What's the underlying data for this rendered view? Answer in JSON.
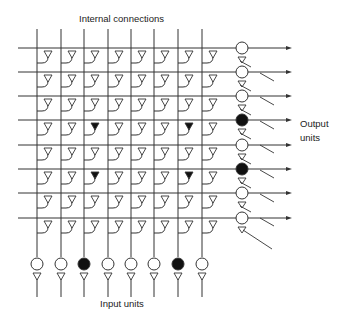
{
  "diagram": {
    "title_labels": {
      "internal": "Internal connections",
      "input": "Input units",
      "output": "Output units"
    },
    "grid": {
      "rows": 8,
      "cols": 8,
      "col_x": [
        37,
        61,
        84,
        108,
        131,
        154,
        178,
        202
      ],
      "row_y": [
        48,
        72,
        96,
        120,
        145,
        169,
        193,
        218
      ],
      "vertical_top": 29,
      "horizontal_left": 18
    },
    "active_synapses": [
      [
        3,
        2
      ],
      [
        3,
        6
      ],
      [
        5,
        2
      ],
      [
        5,
        6
      ]
    ],
    "input_units": {
      "count": 8,
      "circle_y": 264,
      "line_bottom": 297,
      "active": [
        2,
        6
      ]
    },
    "output_units": {
      "count": 8,
      "circle_x": 242,
      "arrow_end_x": 292,
      "active": [
        3,
        5
      ]
    },
    "colors": {
      "line": "#333333",
      "fill_active": "#111111",
      "fill_inactive": "#ffffff",
      "text": "#222222"
    }
  }
}
